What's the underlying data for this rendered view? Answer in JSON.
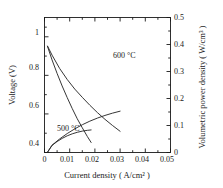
{
  "chart_data": {
    "type": "line",
    "title": "",
    "xlabel": "Current density ( A/cm² )",
    "ylabel": "Voltage (V)",
    "y2label": "Volumetric power density ( W/cm³ )",
    "xlim": [
      0,
      0.05
    ],
    "ylim": [
      0.4,
      1.1
    ],
    "y2lim": [
      0,
      0.5
    ],
    "grid": false,
    "legend_position": "inline-annotations",
    "xticks": [
      0,
      0.01,
      0.02,
      0.03,
      0.04,
      0.05
    ],
    "xticklabels": [
      "0",
      "0.01",
      "0.02",
      "0.03",
      "0.04",
      "0.05"
    ],
    "yticks": [
      0.4,
      0.6,
      0.8,
      1.0
    ],
    "yticklabels": [
      "0.4",
      "0.6",
      "0.8",
      "1"
    ],
    "y2ticks": [
      0,
      0.1,
      0.2,
      0.3,
      0.4,
      0.5
    ],
    "y2ticklabels": [
      "0",
      "0.1",
      "0.2",
      "0.3",
      "0.4",
      "0.5"
    ],
    "x_minor_ticks": [
      0.005,
      0.015,
      0.025,
      0.035,
      0.045
    ],
    "y_minor_ticks": [
      0.5,
      0.7,
      0.9,
      1.05
    ],
    "annotations": [
      {
        "text": "600 °C",
        "x": 0.026,
        "y_axis": "right",
        "y": 0.325
      },
      {
        "text": "500 °C",
        "x": 0.0075,
        "y_axis": "left",
        "y": 0.545
      }
    ],
    "series": [
      {
        "name": "Voltage 600 °C",
        "axis": "left",
        "x": [
          0.0012,
          0.003,
          0.006,
          0.009,
          0.012,
          0.015,
          0.018,
          0.021,
          0.024,
          0.027,
          0.03
        ],
        "values": [
          0.952,
          0.905,
          0.836,
          0.779,
          0.729,
          0.686,
          0.645,
          0.607,
          0.572,
          0.54,
          0.51
        ]
      },
      {
        "name": "Voltage 500 °C",
        "axis": "left",
        "x": [
          0.0012,
          0.003,
          0.005,
          0.007,
          0.009,
          0.011,
          0.013,
          0.015,
          0.017,
          0.0185
        ],
        "values": [
          0.95,
          0.88,
          0.81,
          0.745,
          0.685,
          0.628,
          0.575,
          0.528,
          0.483,
          0.452
        ]
      },
      {
        "name": "Power 600 °C",
        "axis": "right",
        "x": [
          0.0012,
          0.003,
          0.006,
          0.009,
          0.012,
          0.015,
          0.018,
          0.021,
          0.024,
          0.027,
          0.03
        ],
        "values": [
          0.0012,
          0.0272,
          0.0502,
          0.0701,
          0.0875,
          0.1029,
          0.1161,
          0.1275,
          0.1373,
          0.1458,
          0.153
        ]
      },
      {
        "name": "Power 500 °C",
        "axis": "right",
        "x": [
          0.0012,
          0.003,
          0.005,
          0.007,
          0.009,
          0.011,
          0.013,
          0.015,
          0.017,
          0.0185
        ],
        "values": [
          0.0011,
          0.0264,
          0.0405,
          0.0522,
          0.0617,
          0.0691,
          0.0748,
          0.0792,
          0.0821,
          0.0836
        ]
      }
    ],
    "colors": {
      "axis": "#1a1a1a",
      "curve": "#2b2b2b",
      "background": "#ffffff"
    }
  }
}
